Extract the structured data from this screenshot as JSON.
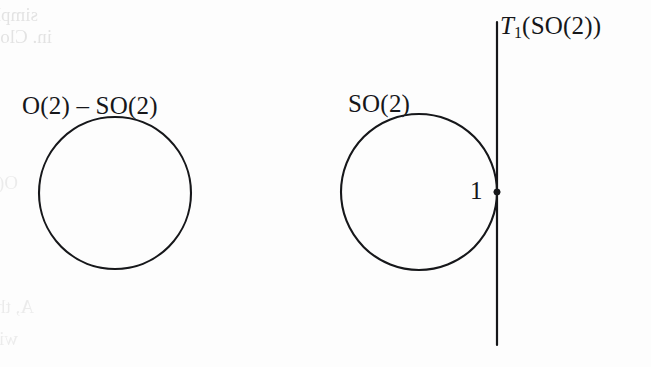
{
  "figure": {
    "caption_type": "math-diagram",
    "background_color": "#fdfdfd",
    "ink_color": "#16171a",
    "labels": {
      "left_circle": "O(2) – SO(2)",
      "right_circle": "SO(2)",
      "tangent_line_T": "T",
      "tangent_line_sub": "1",
      "tangent_line_arg": "(SO(2))",
      "tangent_point": "1"
    },
    "shapes": {
      "left_circle": {
        "cx": 115,
        "cy": 193,
        "r": 76,
        "stroke_width": 2.1
      },
      "right_circle": {
        "cx": 419,
        "cy": 192,
        "r": 78,
        "stroke_width": 2.1
      },
      "tangent_line": {
        "x": 497,
        "y1": 22,
        "y2": 345,
        "stroke_width": 2.2
      },
      "tangent_point_dot": {
        "cx": 497,
        "cy": 192,
        "r": 3.1
      }
    }
  },
  "ghost_text": {
    "lines": [
      {
        "text": "simply connected.  But here's x-axis",
        "x": 38,
        "y": 4,
        "size": 19,
        "strong": true
      },
      {
        "text": "in. Closely vertical, another example",
        "x": 52,
        "y": 26,
        "size": 19,
        "strong": true
      },
      {
        "text": "O(2)  SO(2) ages of map of group T2  SO(2)",
        "x": 18,
        "y": 172,
        "size": 19,
        "strong": false
      },
      {
        "text": "A, the representation product of SU x SO(2)",
        "x": 34,
        "y": 296,
        "size": 19,
        "strong": false
      },
      {
        "text": "with the (H) structure, we shall now commute some cell",
        "x": 18,
        "y": 328,
        "size": 19,
        "strong": false
      }
    ]
  }
}
